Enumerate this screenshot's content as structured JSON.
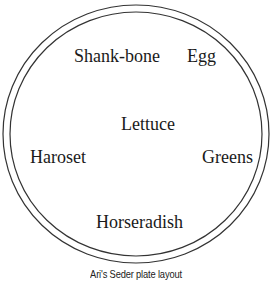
{
  "diagram": {
    "type": "seder-plate",
    "items": [
      {
        "label": "Shank-bone",
        "position": "top-left"
      },
      {
        "label": "Egg",
        "position": "top-right"
      },
      {
        "label": "Lettuce",
        "position": "center"
      },
      {
        "label": "Haroset",
        "position": "left"
      },
      {
        "label": "Greens",
        "position": "right"
      },
      {
        "label": "Horseradish",
        "position": "bottom"
      }
    ],
    "caption": "Ari's Seder plate layout",
    "stroke_color": "#333333"
  }
}
